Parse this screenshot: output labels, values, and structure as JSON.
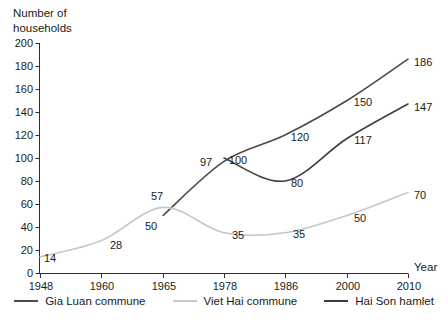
{
  "chart_data": {
    "type": "line",
    "title": "",
    "ylabel": "Number of households",
    "xlabel": "Year",
    "categories": [
      "1948",
      "1960",
      "1965",
      "1978",
      "1986",
      "2000",
      "2010"
    ],
    "y_ticks": [
      0,
      20,
      40,
      60,
      80,
      100,
      120,
      140,
      160,
      180,
      200
    ],
    "ylim": [
      0,
      200
    ],
    "grid": false,
    "legend_position": "bottom",
    "line_style": "smoothed",
    "data_labels_shown": true,
    "series": [
      {
        "name": "Gia Luan commune",
        "color": "#4a4a4a",
        "values": [
          null,
          null,
          50,
          97,
          120,
          150,
          186
        ]
      },
      {
        "name": "Viet Hai commune",
        "color": "#c7c7c7",
        "values": [
          14,
          28,
          57,
          35,
          35,
          50,
          70
        ]
      },
      {
        "name": "Hai Son hamlet",
        "color": "#3e3e3e",
        "values": [
          null,
          null,
          null,
          100,
          80,
          117,
          147
        ]
      }
    ],
    "axis_color": "#2e2e2e",
    "text_color": "#1a1a1a"
  }
}
